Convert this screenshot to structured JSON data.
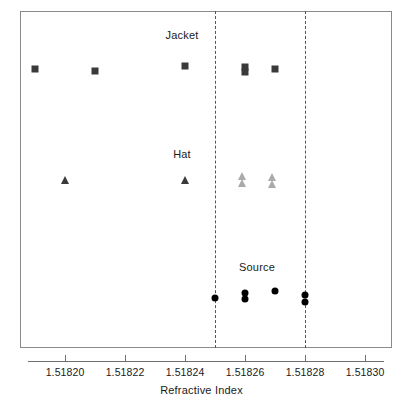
{
  "chart_data": {
    "type": "scatter",
    "title": "",
    "xlabel": "Refractive Index",
    "ylabel": "",
    "xlim": [
      1.518185,
      1.518309
    ],
    "grid": false,
    "legend_position": "none",
    "x_ticks": [
      {
        "value": 1.5182,
        "label": "1.51820"
      },
      {
        "value": 1.51822,
        "label": "1.51822"
      },
      {
        "value": 1.51824,
        "label": "1.51824"
      },
      {
        "value": 1.51826,
        "label": "1.51826"
      },
      {
        "value": 1.51828,
        "label": "1.51828"
      },
      {
        "value": 1.5183,
        "label": "1.51830"
      }
    ],
    "reference_lines": [
      {
        "value": 1.51825,
        "style": "dashed",
        "color": "#555555"
      },
      {
        "value": 1.51828,
        "style": "dashed",
        "color": "#555555"
      }
    ],
    "groups": [
      {
        "name": "Jacket",
        "label": "Jacket",
        "label_x": 1.518239,
        "marker": "square",
        "row_y": 69,
        "label_y": 29,
        "points": [
          {
            "x": 1.51819,
            "color": "#3a3a3a",
            "dy": 0
          },
          {
            "x": 1.51821,
            "color": "#3a3a3a",
            "dy": 2
          },
          {
            "x": 1.51824,
            "color": "#3a3a3a",
            "dy": -3
          },
          {
            "x": 1.51826,
            "color": "#3a3a3a",
            "dy": -2
          },
          {
            "x": 1.51826,
            "color": "#3a3a3a",
            "dy": 3
          },
          {
            "x": 1.51827,
            "color": "#3a3a3a",
            "dy": 0
          }
        ]
      },
      {
        "name": "Hat",
        "label": "Hat",
        "label_x": 1.518239,
        "marker": "triangle",
        "row_y": 180,
        "label_y": 148,
        "points": [
          {
            "x": 1.5182,
            "color": "#3a3a3a",
            "dy": 0
          },
          {
            "x": 1.51824,
            "color": "#3a3a3a",
            "dy": 0
          },
          {
            "x": 1.518259,
            "color": "#aaaaaa",
            "dy": -4
          },
          {
            "x": 1.518259,
            "color": "#aaaaaa",
            "dy": 3
          },
          {
            "x": 1.518269,
            "color": "#aaaaaa",
            "dy": -3
          },
          {
            "x": 1.518269,
            "color": "#aaaaaa",
            "dy": 4
          }
        ]
      },
      {
        "name": "Source",
        "label": "Source",
        "label_x": 1.518264,
        "marker": "circle",
        "row_y": 298,
        "label_y": 261,
        "points": [
          {
            "x": 1.51825,
            "color": "#000000",
            "dy": 0
          },
          {
            "x": 1.51826,
            "color": "#000000",
            "dy": -5
          },
          {
            "x": 1.51826,
            "color": "#000000",
            "dy": 1
          },
          {
            "x": 1.51827,
            "color": "#000000",
            "dy": -7
          },
          {
            "x": 1.51828,
            "color": "#000000",
            "dy": -3
          },
          {
            "x": 1.51828,
            "color": "#000000",
            "dy": 4
          }
        ]
      }
    ]
  }
}
